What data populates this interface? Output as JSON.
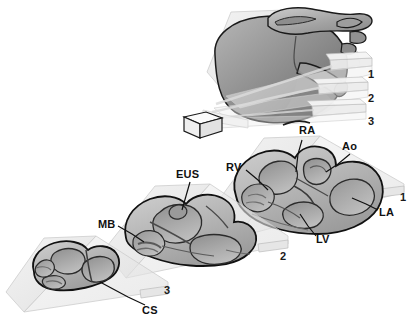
{
  "figure": {
    "type": "anatomical-diagram",
    "style": "grayscale shaded 3D illustration",
    "background_color": "#ffffff",
    "outline_color": "#111111",
    "plane_fill_color": "#e9e9e9",
    "tissue_light_color": "#cfcfcf",
    "tissue_mid_color": "#a8a8a8",
    "tissue_dark_color": "#777777",
    "cavity_color": "#8f8f8f"
  },
  "planes": {
    "labels": [
      {
        "id": "plane-1",
        "text": "1",
        "x": 368,
        "y": 69
      },
      {
        "id": "plane-2",
        "text": "2",
        "x": 368,
        "y": 93
      },
      {
        "id": "plane-3",
        "text": "3",
        "x": 368,
        "y": 116
      }
    ]
  },
  "sections": [
    {
      "id": "section-1",
      "number": "1",
      "number_x": 400,
      "number_y": 198,
      "labels": [
        {
          "id": "ra",
          "text": "RA",
          "x": 299,
          "y": 132
        },
        {
          "id": "ao",
          "text": "Ao",
          "x": 346,
          "y": 148
        },
        {
          "id": "rv",
          "text": "RV",
          "x": 232,
          "y": 169
        },
        {
          "id": "la",
          "text": "LA",
          "x": 381,
          "y": 213
        },
        {
          "id": "lv",
          "text": "LV",
          "x": 318,
          "y": 240
        }
      ]
    },
    {
      "id": "section-2",
      "number": "2",
      "number_x": 281,
      "number_y": 255,
      "labels": [
        {
          "id": "eus",
          "text": "EUS",
          "x": 178,
          "y": 176
        },
        {
          "id": "mb",
          "text": "MB",
          "x": 100,
          "y": 224
        }
      ]
    },
    {
      "id": "section-3",
      "number": "3",
      "number_x": 164,
      "number_y": 290,
      "labels": [
        {
          "id": "cs",
          "text": "CS",
          "x": 135,
          "y": 311
        }
      ]
    }
  ],
  "orientation_marker": {
    "id": "orientation-cube",
    "shape": "rectangular box",
    "x": 178,
    "y": 112
  },
  "abbreviations": {
    "RA": "right atrium",
    "LA": "left atrium",
    "RV": "right ventricle",
    "LV": "left ventricle",
    "Ao": "aorta",
    "EUS": "eustachian valve",
    "MB": "moderator band",
    "CS": "coronary sinus"
  }
}
